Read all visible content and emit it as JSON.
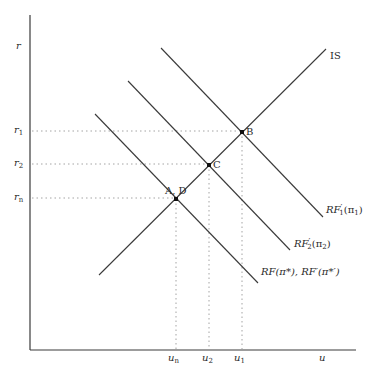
{
  "diagram": {
    "type": "IS-RF macroeconomic diagram",
    "axes": {
      "y_label": "r",
      "x_label": "u",
      "y_ticks": [
        {
          "label_base": "r",
          "label_sub": "1",
          "y": 131
        },
        {
          "label_base": "r",
          "label_sub": "2",
          "y": 164
        },
        {
          "label_base": "r",
          "label_sub": "n",
          "y": 198
        }
      ],
      "x_ticks": [
        {
          "label_base": "u",
          "label_sub": "n",
          "x": 176
        },
        {
          "label_base": "u",
          "label_sub": "2",
          "x": 208
        },
        {
          "label_base": "u",
          "label_sub": "1",
          "x": 241
        }
      ]
    },
    "curves": [
      {
        "name": "IS",
        "label": "IS"
      },
      {
        "name": "RF1",
        "label_main": "RF",
        "label_prime": "′",
        "label_sub": "1",
        "label_arg": "(π",
        "label_arg_sub": "1",
        "label_close": ")"
      },
      {
        "name": "RF2",
        "label_main": "RF",
        "label_prime": "′",
        "label_sub": "2",
        "label_arg": "(π",
        "label_arg_sub": "2",
        "label_close": ")"
      },
      {
        "name": "RF",
        "label": "RF(π*), RF′(π*′)"
      }
    ],
    "points": [
      {
        "name": "B",
        "label": "B"
      },
      {
        "name": "C",
        "label": "C"
      },
      {
        "name": "AD",
        "label": "A, D"
      }
    ],
    "colors": {
      "line": "#3a3a3a",
      "dotted": "#9a9a9a",
      "text": "#2a2a2a"
    }
  }
}
